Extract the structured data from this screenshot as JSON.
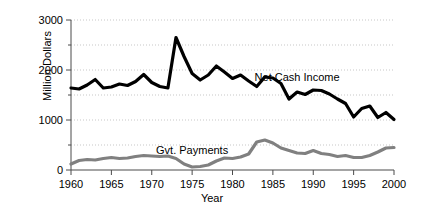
{
  "chart_data": {
    "type": "line",
    "title": "",
    "xlabel": "Year",
    "ylabel": "Million Dollars",
    "xlim": [
      1960,
      2000
    ],
    "ylim": [
      0,
      3000
    ],
    "grid": true,
    "grid_major": [
      0,
      1000,
      2000,
      3000
    ],
    "grid_minor": [
      500,
      1500,
      2500
    ],
    "xticks": [
      1960,
      1965,
      1970,
      1975,
      1980,
      1985,
      1990,
      1995,
      2000
    ],
    "xticklabels": [
      "1960",
      "1965",
      "1970",
      "1975",
      "1980",
      "1985",
      "1990",
      "1995",
      "2000"
    ],
    "yticks": [
      0,
      1000,
      2000,
      3000
    ],
    "yticklabels": [
      "0",
      "1000",
      "2000",
      "3000"
    ],
    "legend_position": "inline-annotations",
    "x": [
      1960,
      1961,
      1962,
      1963,
      1964,
      1965,
      1966,
      1967,
      1968,
      1969,
      1970,
      1971,
      1972,
      1973,
      1974,
      1975,
      1976,
      1977,
      1978,
      1979,
      1980,
      1981,
      1982,
      1983,
      1984,
      1985,
      1986,
      1987,
      1988,
      1989,
      1990,
      1991,
      1992,
      1993,
      1994,
      1995,
      1996,
      1997,
      1998,
      1999,
      2000
    ],
    "series": [
      {
        "name": "Net Cash Income",
        "color": "#000000",
        "linewidth": 3.2,
        "annotation": "Net Cash Income",
        "annotation_x": 1988,
        "annotation_y": 1780,
        "values": [
          1640,
          1620,
          1700,
          1810,
          1640,
          1660,
          1720,
          1690,
          1770,
          1910,
          1750,
          1670,
          1640,
          2650,
          2270,
          1930,
          1800,
          1900,
          2080,
          1960,
          1830,
          1900,
          1780,
          1670,
          1860,
          1840,
          1730,
          1420,
          1560,
          1510,
          1600,
          1590,
          1520,
          1420,
          1330,
          1060,
          1230,
          1280,
          1050,
          1150,
          1010
        ]
      },
      {
        "name": "Gvt. Payments",
        "color": "#808080",
        "linewidth": 3.2,
        "annotation": "Gvt. Payments",
        "annotation_x": 1975,
        "annotation_y": 330,
        "values": [
          120,
          190,
          210,
          200,
          230,
          250,
          230,
          240,
          270,
          290,
          280,
          270,
          280,
          230,
          120,
          60,
          70,
          100,
          180,
          240,
          230,
          260,
          320,
          560,
          600,
          540,
          440,
          390,
          340,
          330,
          390,
          330,
          310,
          270,
          290,
          250,
          250,
          290,
          360,
          440,
          450
        ]
      }
    ]
  },
  "axis": {
    "ylabel": "Million Dollars",
    "xlabel": "Year"
  }
}
